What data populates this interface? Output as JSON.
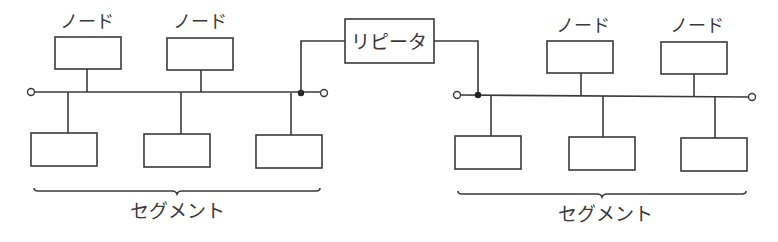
{
  "diagram": {
    "type": "network-segments-with-repeater",
    "repeater": {
      "label": "リピータ"
    },
    "segments": [
      {
        "label": "セグメント",
        "top_nodes": [
          {
            "label": "ノード"
          },
          {
            "label": "ノード"
          }
        ],
        "bottom_nodes": 3
      },
      {
        "label": "セグメント",
        "top_nodes": [
          {
            "label": "ノード"
          },
          {
            "label": "ノード"
          }
        ],
        "bottom_nodes": 3
      }
    ]
  },
  "colors": {
    "line": "#3a3a3a",
    "background": "#ffffff"
  }
}
